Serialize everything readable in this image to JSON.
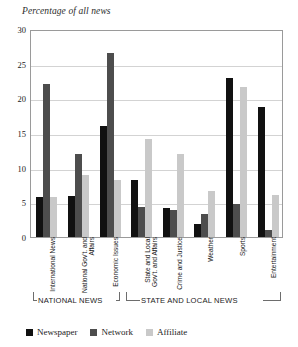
{
  "chart_data": {
    "type": "bar",
    "title": "",
    "ylabel": "Percentage of all news",
    "xlabel": "",
    "ylim": [
      0,
      30
    ],
    "yticks": [
      0,
      5,
      10,
      15,
      20,
      25,
      30
    ],
    "grid": true,
    "legend_position": "bottom-left",
    "categories": [
      "International News",
      "National Gov't. and Affairs",
      "Economic Issues",
      "State and Local Gov't. and Affairs",
      "Crime and Justice",
      "Weather",
      "Sports",
      "Entertainment"
    ],
    "series": [
      {
        "name": "Newspaper",
        "color": "#111111",
        "values": [
          5.7,
          5.9,
          16.0,
          8.2,
          4.2,
          1.9,
          23.0,
          18.7
        ]
      },
      {
        "name": "Network",
        "color": "#4d4d4d",
        "values": [
          22.0,
          12.0,
          26.5,
          4.3,
          3.9,
          3.3,
          4.7,
          1.0
        ]
      },
      {
        "name": "Affiliate",
        "color": "#c9c9c9",
        "values": [
          5.8,
          9.0,
          8.2,
          14.2,
          12.0,
          6.7,
          21.7,
          6.1
        ]
      }
    ],
    "groups": [
      {
        "label": "NATIONAL NEWS",
        "categories": [
          "International News",
          "National Gov't. and Affairs",
          "Economic Issues"
        ]
      },
      {
        "label": "STATE AND LOCAL NEWS",
        "categories": [
          "State and Local Gov't. and Affairs",
          "Crime and Justice",
          "Weather",
          "Sports",
          "Entertainment"
        ]
      }
    ]
  },
  "yticks": {
    "t0": "0",
    "t5": "5",
    "t10": "10",
    "t15": "15",
    "t20": "20",
    "t25": "25",
    "t30": "30"
  },
  "cats": {
    "c0": "International News",
    "c1": "National Gov't. and Affairs",
    "c2": "Economic Issues",
    "c3": "State and Local Gov't. and Affairs",
    "c4": "Crime and Justice",
    "c5": "Weather",
    "c6": "Sports",
    "c7": "Entertainment"
  },
  "sections": {
    "national": "NATIONAL NEWS",
    "statelocal": "STATE AND LOCAL NEWS"
  },
  "legend": {
    "newspaper": "Newspaper",
    "network": "Network",
    "affiliate": "Affiliate"
  }
}
